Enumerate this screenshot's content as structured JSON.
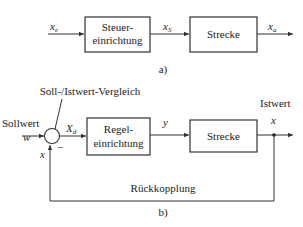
{
  "diagram_a": {
    "caption": "a)",
    "input": {
      "symbol": "x",
      "sub": "e"
    },
    "block1": {
      "line1": "Steuer-",
      "line2": "einrichtung"
    },
    "mid": {
      "symbol": "x",
      "sub": "S"
    },
    "block2": {
      "label": "Strecke"
    },
    "output": {
      "symbol": "x",
      "sub": "a"
    }
  },
  "diagram_b": {
    "caption": "b)",
    "setpoint_label": "Sollwert",
    "setpoint_symbol": "w",
    "comparator_label": "Soll-/Istwert-Vergleich",
    "minus_sign": "−",
    "error": {
      "symbol": "X",
      "sub": "d"
    },
    "block1": {
      "line1": "Regel-",
      "line2": "einrichtung"
    },
    "mid_symbol": "y",
    "block2": {
      "label": "Strecke"
    },
    "actual_label": "Istwert",
    "actual_symbol": "x",
    "feedback_symbol": "x",
    "feedback_label": "Rückkopplung"
  },
  "colors": {
    "line": "#333333",
    "text": "#222222",
    "background": "#ffffff"
  }
}
